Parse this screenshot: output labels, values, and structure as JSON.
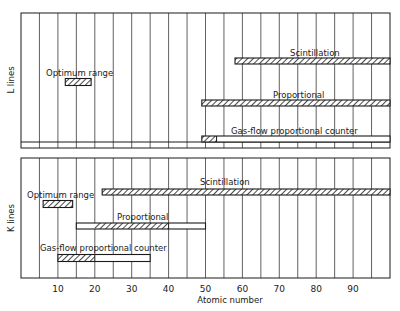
{
  "chart_data": {
    "type": "bar",
    "subtype": "range-bar (horizontal, two panels)",
    "title": "",
    "xlabel": "Atomic number",
    "xlim": [
      0,
      100
    ],
    "x_ticks": [
      10,
      20,
      30,
      40,
      50,
      60,
      70,
      80,
      90
    ],
    "grid": {
      "vertical_every": 5,
      "horizontal": false
    },
    "legend": "none (inline labels)",
    "panels": [
      {
        "ylabel": "L lines",
        "series": [
          {
            "name": "Optimum range",
            "full_range": [
              12,
              19
            ],
            "hatched_range": [
              12,
              19
            ]
          },
          {
            "name": "Scintillation",
            "full_range": [
              58,
              100
            ],
            "hatched_range": [
              58,
              100
            ]
          },
          {
            "name": "Proportional",
            "full_range": [
              49,
              100
            ],
            "hatched_range": [
              49,
              100
            ]
          },
          {
            "name": "Gas-flow proportional counter",
            "full_range": [
              49,
              100
            ],
            "hatched_range": [
              49,
              53
            ]
          }
        ]
      },
      {
        "ylabel": "K lines",
        "series": [
          {
            "name": "Optimum range",
            "full_range": [
              6,
              14
            ],
            "hatched_range": [
              6,
              14
            ]
          },
          {
            "name": "Scintillation",
            "full_range": [
              22,
              100
            ],
            "hatched_range": [
              22,
              100
            ]
          },
          {
            "name": "Proportional",
            "full_range": [
              15,
              50
            ],
            "hatched_range": [
              20,
              40
            ]
          },
          {
            "name": "Gas-flow proportional counter",
            "full_range": [
              10,
              35
            ],
            "hatched_range": [
              10,
              20
            ]
          }
        ]
      }
    ]
  },
  "labels": {
    "xlabel": "Atomic number",
    "top_ylabel": "L lines",
    "bottom_ylabel": "K lines",
    "top_optimum": "Optimum range",
    "top_scint": "Scintillation",
    "top_prop": "Proportional",
    "top_gasflow": "Gas-flow proportional counter",
    "bot_optimum": "Optimum range",
    "bot_scint": "Scintillation",
    "bot_prop": "Proportional",
    "bot_gasflow": "Gas-flow proportional counter",
    "ticks": [
      "10",
      "20",
      "30",
      "40",
      "50",
      "60",
      "70",
      "80",
      "90"
    ]
  }
}
